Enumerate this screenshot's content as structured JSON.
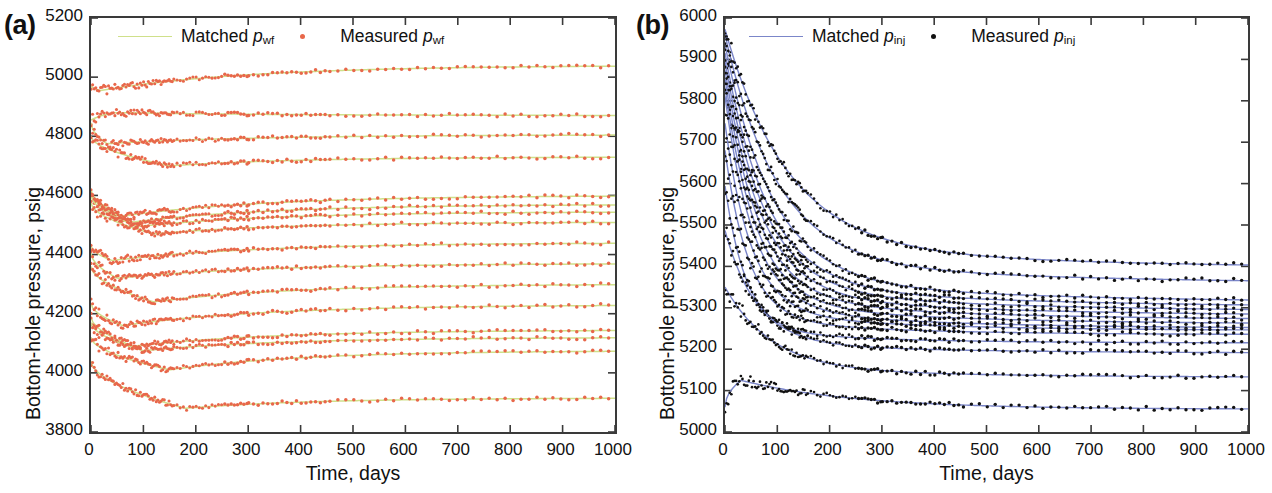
{
  "figure": {
    "width": 1272,
    "height": 493,
    "background": "#ffffff"
  },
  "panels": [
    {
      "tag": "(a)",
      "ylabel": "Bottom-hole pressure, psig",
      "xlabel": "Time, days",
      "legend": {
        "matched_label": "Matched",
        "matched_symbol": "p",
        "matched_sub": "wf",
        "measured_label": "Measured",
        "measured_symbol": "p",
        "measured_sub": "wf",
        "line_color": "#cfe08a",
        "marker_color": "#e8674a"
      }
    },
    {
      "tag": "(b)",
      "ylabel": "Bottom-hole pressure, psig",
      "xlabel": "Time, days",
      "legend": {
        "matched_label": "Matched",
        "matched_symbol": "p",
        "matched_sub": "inj",
        "measured_label": "Measured",
        "measured_symbol": "p",
        "measured_sub": "inj",
        "line_color": "#7b86c9",
        "marker_color": "#111111"
      }
    }
  ],
  "chart_data": [
    {
      "panel": "(a)",
      "type": "scatter",
      "title": "",
      "xlabel": "Time, days",
      "ylabel": "Bottom-hole pressure, psig",
      "xlim": [
        0,
        1000
      ],
      "ylim": [
        3800,
        5200
      ],
      "xticks": [
        0,
        100,
        200,
        300,
        400,
        500,
        600,
        700,
        800,
        900,
        1000
      ],
      "yticks": [
        3800,
        4000,
        4200,
        4400,
        4600,
        4800,
        5000,
        5200
      ],
      "grid": false,
      "legend_position": "top-center",
      "legend_entries": [
        "Matched p_wf",
        "Measured p_wf"
      ],
      "marker_color": "#e8674a",
      "line_color": "#cfe08a",
      "note": "Measured bottom-hole flowing pressure (dots) and history-matched model (line) for 16 producer wells over 1000 days",
      "series": [
        {
          "name": "P1",
          "start": 4970,
          "min": 4955,
          "min_t": 18,
          "end": 5040,
          "shape": "rise"
        },
        {
          "name": "P2",
          "start": 4855,
          "max": 4880,
          "max_t": 55,
          "end": 4870,
          "shape": "bump"
        },
        {
          "name": "P3",
          "start": 4845,
          "min": 4775,
          "min_t": 30,
          "end": 4805,
          "shape": "rise"
        },
        {
          "name": "P4",
          "start": 4800,
          "min": 4700,
          "min_t": 150,
          "end": 4730,
          "shape": "dip-rise"
        },
        {
          "name": "P5",
          "start": 4620,
          "min": 4530,
          "min_t": 60,
          "end": 4600,
          "shape": "rise"
        },
        {
          "name": "P6",
          "start": 4610,
          "min": 4510,
          "min_t": 80,
          "end": 4570,
          "shape": "rise"
        },
        {
          "name": "P7",
          "start": 4600,
          "min": 4495,
          "min_t": 90,
          "end": 4545,
          "shape": "rise"
        },
        {
          "name": "P8",
          "start": 4575,
          "min": 4470,
          "min_t": 120,
          "end": 4510,
          "shape": "rise"
        },
        {
          "name": "P9",
          "start": 4430,
          "min": 4380,
          "min_t": 40,
          "end": 4440,
          "shape": "rise"
        },
        {
          "name": "P10",
          "start": 4405,
          "min": 4320,
          "min_t": 50,
          "end": 4370,
          "shape": "rise"
        },
        {
          "name": "P11",
          "start": 4360,
          "min": 4240,
          "min_t": 120,
          "end": 4300,
          "shape": "dip-rise"
        },
        {
          "name": "P12",
          "start": 4235,
          "min": 4160,
          "min_t": 60,
          "end": 4230,
          "shape": "rise"
        },
        {
          "name": "P13",
          "start": 4190,
          "min": 4090,
          "min_t": 80,
          "end": 4145,
          "shape": "rise"
        },
        {
          "name": "P14",
          "start": 4170,
          "min": 4075,
          "min_t": 100,
          "end": 4120,
          "shape": "rise"
        },
        {
          "name": "P15",
          "start": 4120,
          "min": 4010,
          "min_t": 150,
          "end": 4075,
          "shape": "dip-rise"
        },
        {
          "name": "P16",
          "start": 4040,
          "min": 3880,
          "min_t": 180,
          "end": 3915,
          "shape": "dip-rise"
        }
      ]
    },
    {
      "panel": "(b)",
      "type": "scatter",
      "title": "",
      "xlabel": "Time, days",
      "ylabel": "Bottom-hole pressure, psig",
      "xlim": [
        0,
        1000
      ],
      "ylim": [
        5000,
        6000
      ],
      "xticks": [
        0,
        100,
        200,
        300,
        400,
        500,
        600,
        700,
        800,
        900,
        1000
      ],
      "yticks": [
        5000,
        5100,
        5200,
        5300,
        5400,
        5500,
        5600,
        5700,
        5800,
        5900,
        6000
      ],
      "grid": false,
      "legend_position": "top-center",
      "legend_entries": [
        "Matched p_inj",
        "Measured p_inj"
      ],
      "marker_color": "#111111",
      "line_color": "#7b86c9",
      "note": "Measured bottom-hole injection pressure (dots) and history-matched model (line) for 15 injector wells over 1000 days",
      "series": [
        {
          "name": "I1",
          "start": 5920,
          "end": 5390,
          "decay": 120
        },
        {
          "name": "I2",
          "start": 5905,
          "end": 5355,
          "decay": 100
        },
        {
          "name": "I3",
          "start": 5880,
          "end": 5310,
          "decay": 90
        },
        {
          "name": "I4",
          "start": 5860,
          "end": 5300,
          "decay": 80
        },
        {
          "name": "I5",
          "start": 5840,
          "end": 5290,
          "decay": 75
        },
        {
          "name": "I6",
          "start": 5820,
          "end": 5280,
          "decay": 70
        },
        {
          "name": "I7",
          "start": 5800,
          "end": 5270,
          "decay": 65
        },
        {
          "name": "I8",
          "start": 5780,
          "end": 5260,
          "decay": 60
        },
        {
          "name": "I9",
          "start": 5760,
          "end": 5250,
          "decay": 55
        },
        {
          "name": "I10",
          "start": 5700,
          "end": 5245,
          "decay": 50
        },
        {
          "name": "I11",
          "start": 5640,
          "end": 5235,
          "decay": 45
        },
        {
          "name": "I12",
          "start": 5560,
          "end": 5215,
          "decay": 40
        },
        {
          "name": "I13",
          "start": 5460,
          "end": 5190,
          "decay": 60
        },
        {
          "name": "I14",
          "start": 5330,
          "end": 5130,
          "decay": 90
        },
        {
          "name": "I15",
          "start": 5060,
          "peak": 5125,
          "peak_t": 30,
          "end": 5055,
          "shape": "bump"
        }
      ]
    }
  ]
}
